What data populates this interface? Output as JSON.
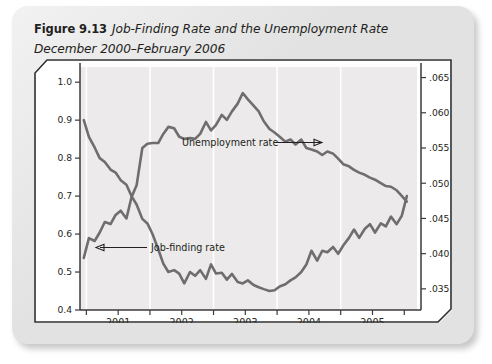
{
  "figure": {
    "label": "Figure 9.13",
    "title": "Job-Finding Rate and the Unemployment Rate December 2000–February 2006"
  },
  "chart_data": {
    "type": "line",
    "title": "Job-Finding Rate and the Unemployment Rate",
    "subtitle": "December 2000–February 2006",
    "xlabel": "",
    "ylabel": "Job-finding rate",
    "y2label": "Unemployment rate",
    "grid": true,
    "legend_position": "inline-annotation",
    "x": [
      2000.96,
      2001.04,
      2001.13,
      2001.21,
      2001.29,
      2001.38,
      2001.46,
      2001.54,
      2001.63,
      2001.71,
      2001.79,
      2001.88,
      2001.96,
      2002.04,
      2002.13,
      2002.21,
      2002.29,
      2002.38,
      2002.46,
      2002.54,
      2002.63,
      2002.71,
      2002.79,
      2002.88,
      2002.96,
      2003.04,
      2003.13,
      2003.21,
      2003.29,
      2003.38,
      2003.46,
      2003.54,
      2003.63,
      2003.71,
      2003.79,
      2003.88,
      2003.96,
      2004.04,
      2004.13,
      2004.21,
      2004.29,
      2004.38,
      2004.46,
      2004.54,
      2004.63,
      2004.71,
      2004.79,
      2004.88,
      2004.96,
      2005.04,
      2005.13,
      2005.21,
      2005.29,
      2005.38,
      2005.46,
      2005.54,
      2005.63,
      2005.71,
      2005.79,
      2005.88,
      2005.96,
      2006.04
    ],
    "xlim": [
      2000.9,
      2006.2
    ],
    "xticks": [
      2001,
      2002,
      2003,
      2004,
      2005
    ],
    "xticklabels": [
      "2001",
      "2002",
      "2003",
      "2004",
      "2005"
    ],
    "series": [
      {
        "name": "Unemployment rate",
        "axis": "right",
        "color": "#6e6e6e",
        "ylim": [
          0.032,
          0.0665
        ],
        "yticks": [
          0.035,
          0.04,
          0.045,
          0.05,
          0.055,
          0.06,
          0.065
        ],
        "yticklabels": [
          ".035",
          ".040",
          ".045",
          ".050",
          ".055",
          ".060",
          ".065"
        ],
        "values": [
          0.0394,
          0.0422,
          0.0418,
          0.043,
          0.0445,
          0.0442,
          0.0455,
          0.0461,
          0.045,
          0.048,
          0.0497,
          0.055,
          0.0556,
          0.0557,
          0.0557,
          0.057,
          0.058,
          0.0578,
          0.0566,
          0.0563,
          0.0564,
          0.0563,
          0.057,
          0.0587,
          0.0575,
          0.0583,
          0.0597,
          0.059,
          0.0602,
          0.0613,
          0.0628,
          0.0619,
          0.061,
          0.0602,
          0.0588,
          0.0577,
          0.0572,
          0.0566,
          0.0559,
          0.0562,
          0.0555,
          0.0562,
          0.055,
          0.0548,
          0.0545,
          0.054,
          0.0545,
          0.0542,
          0.0535,
          0.0527,
          0.0524,
          0.0519,
          0.0515,
          0.0512,
          0.0508,
          0.0505,
          0.05,
          0.0496,
          0.0495,
          0.049,
          0.0482,
          0.0474
        ]
      },
      {
        "name": "Job-finding rate",
        "axis": "left",
        "color": "#6e6e6e",
        "ylim": [
          0.4,
          1.04
        ],
        "yticks": [
          0.4,
          0.5,
          0.6,
          0.7,
          0.8,
          0.9,
          1.0
        ],
        "yticklabels": [
          "0.4",
          "0.5",
          "0.6",
          "0.7",
          "0.8",
          "0.9",
          "1.0"
        ],
        "values": [
          0.9,
          0.856,
          0.828,
          0.8,
          0.79,
          0.77,
          0.762,
          0.742,
          0.73,
          0.7,
          0.678,
          0.64,
          0.628,
          0.6,
          0.56,
          0.522,
          0.5,
          0.505,
          0.496,
          0.47,
          0.5,
          0.49,
          0.505,
          0.482,
          0.52,
          0.496,
          0.498,
          0.48,
          0.495,
          0.474,
          0.47,
          0.478,
          0.466,
          0.46,
          0.455,
          0.45,
          0.452,
          0.462,
          0.468,
          0.478,
          0.486,
          0.5,
          0.52,
          0.556,
          0.53,
          0.556,
          0.552,
          0.566,
          0.548,
          0.57,
          0.59,
          0.612,
          0.59,
          0.614,
          0.626,
          0.604,
          0.628,
          0.62,
          0.646,
          0.626,
          0.648,
          0.7
        ]
      }
    ],
    "annotations": [
      {
        "text": "Unemployment rate",
        "arrow": "right"
      },
      {
        "text": "Job-finding rate",
        "arrow": "left"
      }
    ]
  }
}
